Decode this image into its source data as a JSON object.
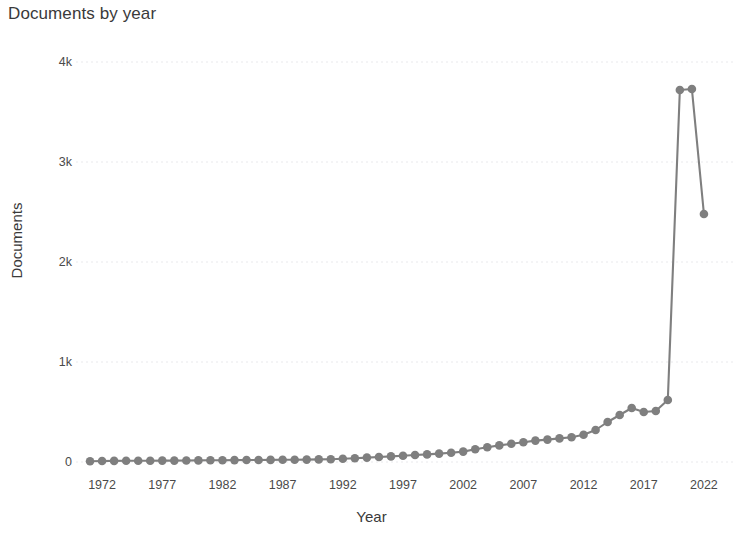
{
  "chart_data": {
    "type": "line",
    "title": "Documents by year",
    "xlabel": "Year",
    "ylabel": "Documents",
    "grid": true,
    "legend": null,
    "marker": "circle",
    "line_color": "#7f7f7f",
    "marker_color": "#7f7f7f",
    "xlim": [
      1970,
      2024
    ],
    "ylim": [
      0,
      4000
    ],
    "ytick_values": [
      0,
      1000,
      2000,
      3000,
      4000
    ],
    "ytick_labels": [
      "0",
      "1k",
      "2k",
      "3k",
      "4k"
    ],
    "xtick_values": [
      1972,
      1977,
      1982,
      1987,
      1992,
      1997,
      2002,
      2007,
      2012,
      2017,
      2022
    ],
    "xtick_labels": [
      "1972",
      "1977",
      "1982",
      "1987",
      "1992",
      "1997",
      "2002",
      "2007",
      "2012",
      "2017",
      "2022"
    ],
    "x": [
      1971,
      1972,
      1973,
      1974,
      1975,
      1976,
      1977,
      1978,
      1979,
      1980,
      1981,
      1982,
      1983,
      1984,
      1985,
      1986,
      1987,
      1988,
      1989,
      1990,
      1991,
      1992,
      1993,
      1994,
      1995,
      1996,
      1997,
      1998,
      1999,
      2000,
      2001,
      2002,
      2003,
      2004,
      2005,
      2006,
      2007,
      2008,
      2009,
      2010,
      2011,
      2012,
      2013,
      2014,
      2015,
      2016,
      2017,
      2018,
      2019,
      2020,
      2021,
      2022
    ],
    "values": [
      8,
      10,
      11,
      12,
      12,
      13,
      14,
      14,
      15,
      16,
      17,
      18,
      19,
      20,
      20,
      21,
      22,
      23,
      24,
      26,
      28,
      32,
      38,
      44,
      50,
      56,
      62,
      70,
      76,
      84,
      92,
      104,
      128,
      148,
      166,
      182,
      198,
      214,
      224,
      236,
      248,
      272,
      320,
      400,
      470,
      540,
      500,
      510,
      620,
      3720,
      3730,
      2480
    ],
    "series_name": "Documents"
  }
}
